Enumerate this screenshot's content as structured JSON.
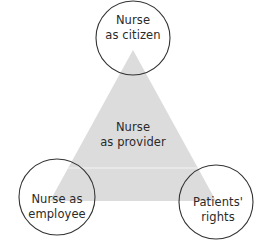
{
  "diagram": {
    "center": {
      "line1": "Nurse",
      "line2": "as provider"
    },
    "top": {
      "line1": "Nurse",
      "line2": "as citizen"
    },
    "bottom_left": {
      "line1": "Nurse as",
      "line2": "employee"
    },
    "bottom_right": {
      "line1": "Patients'",
      "line2": "rights"
    },
    "colors": {
      "triangle": "#dcdcdc",
      "circle_stroke": "#333333",
      "text": "#2a2a2a"
    }
  }
}
